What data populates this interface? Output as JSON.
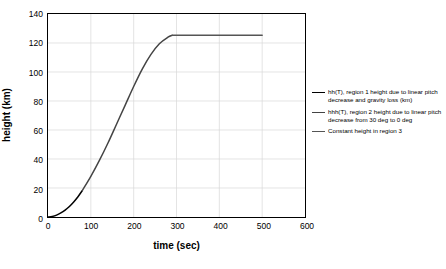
{
  "chart_data": {
    "type": "line",
    "title": "",
    "xlabel": "time (sec)",
    "ylabel": "height (km)",
    "xlim": [
      0,
      600
    ],
    "ylim": [
      0,
      140
    ],
    "xticks": [
      0,
      100,
      200,
      300,
      400,
      500,
      600
    ],
    "yticks": [
      0,
      20,
      40,
      60,
      80,
      100,
      120,
      140
    ],
    "grid": true,
    "legend_position": "right",
    "series": [
      {
        "name": "hh(T), region 1 height due to linear pitch decrease and gravity loss (km)",
        "color": "#000000",
        "x": [
          0,
          10,
          20,
          30,
          40,
          50,
          60,
          70,
          80
        ],
        "y": [
          0,
          0.4,
          1.3,
          2.8,
          4.8,
          7.3,
          10.4,
          14.0,
          18.2
        ]
      },
      {
        "name": "hhh(T), region 2 height due to linear pitch decrease from 30 deg to 0 deg",
        "color": "#444444",
        "x": [
          80,
          100,
          120,
          140,
          160,
          180,
          200,
          220,
          240,
          260,
          280,
          290
        ],
        "y": [
          18.2,
          28.0,
          39.0,
          51.0,
          64.0,
          77.0,
          90.0,
          102.0,
          112.0,
          119.5,
          124.0,
          125.3
        ]
      },
      {
        "name": "Constant height in region 3",
        "color": "#555555",
        "x": [
          290,
          500
        ],
        "y": [
          125.3,
          125.3
        ]
      }
    ]
  },
  "legend": {
    "entries": [
      "hh(T), region 1 height due to linear pitch decrease and gravity loss (km)",
      "hhh(T), region 2 height due to linear pitch decrease from 30 deg to 0 deg",
      "Constant height in region 3"
    ]
  }
}
